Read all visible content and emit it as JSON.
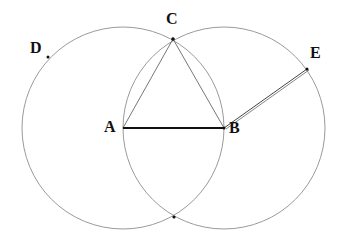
{
  "diagram": {
    "type": "geometric-construction",
    "points": {
      "A": {
        "label": "A",
        "x": 123,
        "y": 128
      },
      "B": {
        "label": "B",
        "x": 224,
        "y": 128
      },
      "C": {
        "label": "C",
        "x": 173,
        "y": 39
      },
      "D": {
        "label": "D",
        "x": 48,
        "y": 57
      },
      "E": {
        "label": "E",
        "x": 307,
        "y": 69
      },
      "F": {
        "label": "",
        "x": 174,
        "y": 217
      }
    },
    "circles": [
      {
        "center": "A",
        "radius": 101
      },
      {
        "center": "B",
        "radius": 101
      }
    ],
    "segments": [
      {
        "from": "A",
        "to": "B",
        "style": "bold"
      },
      {
        "from": "A",
        "to": "C",
        "style": "thin"
      },
      {
        "from": "B",
        "to": "C",
        "style": "thin"
      },
      {
        "from": "B",
        "to": "E",
        "style": "double"
      }
    ],
    "colors": {
      "circle": "#9a9a9a",
      "line": "#555555",
      "bold_line": "#111111",
      "label": "#111111"
    }
  }
}
